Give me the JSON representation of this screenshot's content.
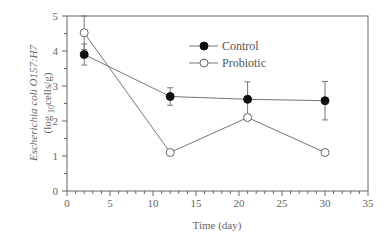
{
  "chart_data": {
    "type": "line",
    "title": "",
    "xlabel": "Time (day)",
    "ylabel_line1": "Escherichia coli O157:H7",
    "ylabel_line2": "(log10cells/g)",
    "xlim": [
      0,
      35
    ],
    "ylim": [
      0,
      5
    ],
    "xticks": [
      0,
      5,
      10,
      15,
      20,
      25,
      30,
      35
    ],
    "yticks": [
      0,
      1,
      2,
      3,
      4,
      5
    ],
    "grid": false,
    "legend_position": "upper center",
    "series": [
      {
        "name": "Control",
        "marker": "filled-circle",
        "x": [
          2,
          12,
          21,
          30
        ],
        "y": [
          3.9,
          2.7,
          2.62,
          2.58
        ],
        "err": [
          0.3,
          0.25,
          0.5,
          0.55
        ]
      },
      {
        "name": "Probiotic",
        "marker": "open-circle",
        "x": [
          2,
          12,
          21,
          30
        ],
        "y": [
          4.52,
          1.1,
          2.1,
          1.1
        ],
        "err": [
          0.48,
          0,
          0,
          0
        ]
      }
    ]
  },
  "colors": {
    "line": "#777777",
    "marker_fill": "#111111",
    "axis": "#666666"
  }
}
